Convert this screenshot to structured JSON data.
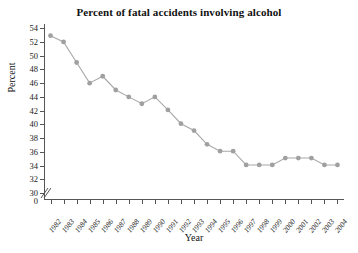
{
  "chart_data": {
    "type": "line",
    "title": "Percent of fatal accidents involving alcohol",
    "xlabel": "Year",
    "ylabel": "Percent",
    "categories": [
      "1982",
      "1983",
      "1984",
      "1985",
      "1986",
      "1987",
      "1988",
      "1989",
      "1990",
      "1991",
      "1992",
      "1993",
      "1994",
      "1995",
      "1996",
      "1997",
      "1998",
      "1999",
      "2000",
      "2001",
      "2002",
      "2003",
      "2004"
    ],
    "values": [
      52.9,
      52.0,
      49.0,
      46.0,
      47.0,
      45.0,
      44.0,
      43.0,
      44.0,
      42.1,
      40.1,
      39.1,
      37.1,
      36.1,
      36.1,
      34.1,
      34.1,
      34.1,
      35.1,
      35.1,
      35.1,
      34.1,
      34.1
    ],
    "ytick_labels": [
      "0",
      "30",
      "32",
      "34",
      "36",
      "38",
      "40",
      "42",
      "44",
      "46",
      "48",
      "50",
      "52",
      "54"
    ],
    "ylim": [
      29.0,
      54.6
    ],
    "ylim_label_min": 30,
    "ylim_label_max": 54,
    "axis_break": true,
    "axis_break_label": "0",
    "grid": false,
    "legend": "none",
    "series_color": "#a0a0a0",
    "line_color": "#a8a8a8",
    "axis_color": "#555555",
    "text_color": "#111111",
    "background": "#ffffff",
    "marker": "circle",
    "series": [
      {
        "name": "Percent of fatal accidents involving alcohol",
        "values": [
          52.9,
          52.0,
          49.0,
          46.0,
          47.0,
          45.0,
          44.0,
          43.0,
          44.0,
          42.1,
          40.1,
          39.1,
          37.1,
          36.1,
          36.1,
          34.1,
          34.1,
          34.1,
          35.1,
          35.1,
          35.1,
          34.1,
          34.1
        ]
      }
    ]
  }
}
